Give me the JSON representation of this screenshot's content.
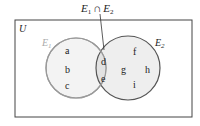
{
  "diagram": {
    "type": "venn",
    "universe_label": "U",
    "intersection_label": {
      "set_a": "E",
      "sub_a": "1",
      "op": "∩",
      "set_b": "E",
      "sub_b": "2"
    },
    "sets": [
      {
        "name": "E",
        "subscript": "1",
        "elements_only": [
          "a",
          "b",
          "c"
        ],
        "color": "#999999",
        "fill": "#f3f3f3"
      },
      {
        "name": "E",
        "subscript": "2",
        "elements_only": [
          "f",
          "g",
          "h",
          "i"
        ],
        "color": "#555555",
        "fill": "#eeeeee"
      }
    ],
    "intersection_elements": [
      "d",
      "e"
    ],
    "colors": {
      "border": "#444444",
      "e1_stroke": "#9a9a9a",
      "e2_stroke": "#555555",
      "overlap_fill": "#e2e2e2"
    }
  }
}
